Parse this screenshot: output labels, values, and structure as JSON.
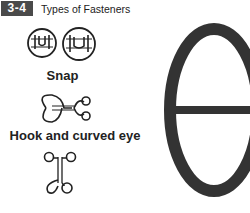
{
  "figure": {
    "number": "3-4",
    "title": "Types of Fasteners"
  },
  "items": [
    {
      "label": "Snap",
      "icon": "snap-icon"
    },
    {
      "label": "Hook and curved eye",
      "icon": "hook-and-curved-eye-icon"
    },
    {
      "label": "",
      "icon": "hook-and-eye-icon"
    },
    {
      "label": "",
      "icon": "eye-icon"
    }
  ],
  "colors": {
    "badge_bg": "#4a4a4a",
    "ink": "#222222"
  }
}
